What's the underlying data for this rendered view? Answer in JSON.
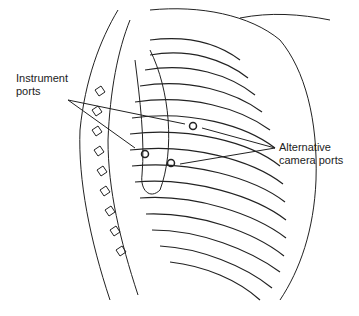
{
  "diagram": {
    "labels": {
      "instrument_ports_line1": "Instrument",
      "instrument_ports_line2": "ports",
      "camera_ports_line1": "Alternative",
      "camera_ports_line2": "camera ports"
    },
    "ports": [
      {
        "name": "upper-port",
        "x": 193,
        "y": 126
      },
      {
        "name": "left-port",
        "x": 145,
        "y": 154
      },
      {
        "name": "right-port",
        "x": 171,
        "y": 163
      }
    ],
    "colors": {
      "line": "#222222",
      "background": "#ffffff"
    }
  }
}
